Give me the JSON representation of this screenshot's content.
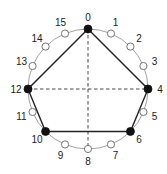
{
  "diagram": {
    "type": "circle-with-16-points-and-polygon",
    "center": [
      88,
      89
    ],
    "radius": 60,
    "point_count": 16,
    "labels": [
      "0",
      "1",
      "2",
      "3",
      "4",
      "5",
      "6",
      "7",
      "8",
      "9",
      "10",
      "11",
      "12",
      "13",
      "14",
      "15"
    ],
    "filled_points": [
      0,
      4,
      6,
      10,
      12
    ],
    "polygon_order": [
      0,
      4,
      6,
      10,
      12
    ],
    "dashed_lines": [
      [
        0,
        8
      ],
      [
        12,
        4
      ]
    ],
    "colors": {
      "circle": "#888888",
      "polygon": "#222222",
      "filled_point": "#111111",
      "open_point_fill": "#ffffff",
      "open_point_stroke": "#555555",
      "dashed": "#333333"
    }
  }
}
